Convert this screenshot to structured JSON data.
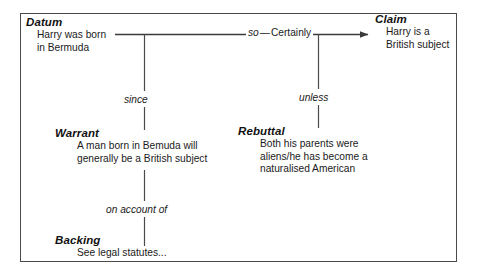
{
  "diagram": {
    "type": "toulmin-argument-diagram",
    "background_color": "#ffffff",
    "line_color": "#4a4a4a",
    "text_color": "#1a1a1a",
    "nodes": [
      {
        "id": "datum",
        "label": "Datum",
        "lines": [
          "Harry was born",
          "in Bermuda"
        ]
      },
      {
        "id": "claim",
        "label": "Claim",
        "lines": [
          "Harry is a",
          "British subject"
        ]
      },
      {
        "id": "warrant",
        "label": "Warrant",
        "lines": [
          "A man born in Bemuda will",
          "generally be a British subject"
        ]
      },
      {
        "id": "rebuttal",
        "label": "Rebuttal",
        "lines": [
          "Both his parents were",
          "aliens/he has become a",
          "naturalised American"
        ]
      },
      {
        "id": "backing",
        "label": "Backing",
        "lines": [
          "See legal statutes..."
        ]
      }
    ],
    "edges": {
      "qualifier": {
        "connective": "so",
        "dash": "—",
        "force": "Certainly"
      },
      "since": "since",
      "unless": "unless",
      "on_account_of": "on account of"
    }
  }
}
